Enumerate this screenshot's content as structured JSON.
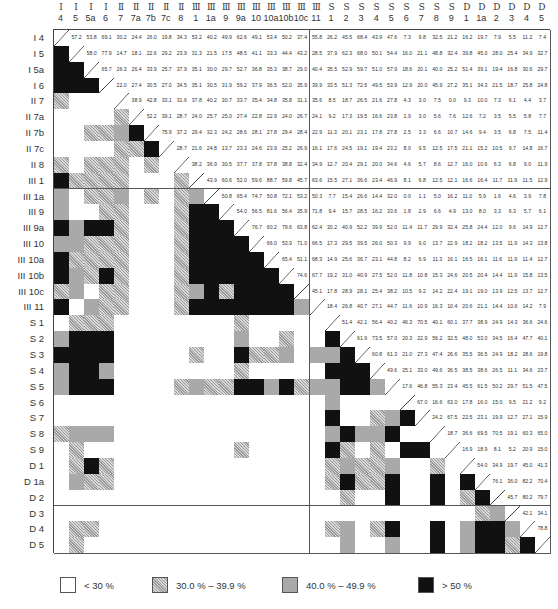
{
  "chart_data": {
    "type": "heatmap",
    "title": "",
    "layout": {
      "matrix": "symmetric; upper triangle shows values (%), lower triangle shows shaded categories",
      "diagonal": "diagonal line"
    },
    "labels": {
      "groups": [
        "I",
        "I",
        "I",
        "I",
        "II",
        "II",
        "II",
        "II",
        "II",
        "III",
        "III",
        "III",
        "III",
        "III",
        "III",
        "III",
        "III",
        "III",
        "S",
        "S",
        "S",
        "S",
        "S",
        "S",
        "S",
        "S",
        "S",
        "D",
        "D",
        "D",
        "D",
        "D",
        "D"
      ],
      "cols": [
        "4",
        "5",
        "5a",
        "6",
        "7",
        "7a",
        "7b",
        "7c",
        "8",
        "1",
        "1a",
        "9",
        "9a",
        "10",
        "10a",
        "10b",
        "10c",
        "11",
        "1",
        "2",
        "3",
        "4",
        "5",
        "6",
        "7",
        "8",
        "9",
        "1",
        "1a",
        "2",
        "3",
        "4",
        "5"
      ],
      "rows": [
        "I4",
        "I5",
        "I5a",
        "I6",
        "II7",
        "II7a",
        "II7b",
        "II7c",
        "II8",
        "III1",
        "III1a",
        "III9",
        "III9a",
        "III10",
        "III10a",
        "III10b",
        "III10c",
        "III11",
        "S1",
        "S2",
        "S3",
        "S4",
        "S5",
        "S6",
        "S7",
        "S8",
        "S9",
        "D1",
        "D1a",
        "D2",
        "D3",
        "D4",
        "D5"
      ]
    },
    "upper_values": [
      [
        57.2,
        53.8,
        69.1,
        30.2,
        24.4,
        26.0,
        19.8,
        34.3,
        53.2,
        40.2,
        49.9,
        62.6,
        49.1,
        53.4,
        50.2,
        37.4,
        55.8,
        26.2,
        45.5,
        68.4,
        43.9,
        47.6,
        7.3,
        9.8,
        32.5,
        21.2,
        16.2,
        19.7,
        7.9,
        5.5,
        11.2,
        7.4
      ],
      [
        58.0,
        77.9,
        14.7,
        18.1,
        22.6,
        29.2,
        23.9,
        31.3,
        21.5,
        17.5,
        48.5,
        41.1,
        33.3,
        44.4,
        43.2,
        28.5,
        37.9,
        62.3,
        68.0,
        50.1,
        54.4,
        16.0,
        21.1,
        48.8,
        32.4,
        39.8,
        45.0,
        28.0,
        25.4,
        34.9,
        32.7
      ],
      [
        65.7,
        26.3,
        26.4,
        33.9,
        25.7,
        37.9,
        35.1,
        30.0,
        29.7,
        52.7,
        36.8,
        35.3,
        38.7,
        29.0,
        40.4,
        35.5,
        52.9,
        59.7,
        51.0,
        57.9,
        18.6,
        20.1,
        40.0,
        25.2,
        51.4,
        39.1,
        19.4,
        16.8,
        30.6,
        29.7
      ],
      [
        22.0,
        27.4,
        30.5,
        27.0,
        34.5,
        35.1,
        30.5,
        31.9,
        59.2,
        37.9,
        36.5,
        52.0,
        35.9,
        39.9,
        33.5,
        51.3,
        72.5,
        49.5,
        53.9,
        12.9,
        20.0,
        45.9,
        27.2,
        35.1,
        34.3,
        21.5,
        18.7,
        25.8,
        24.8
      ],
      [
        38.9,
        42.8,
        33.1,
        31.6,
        37.8,
        40.2,
        30.7,
        33.7,
        35.4,
        34.8,
        35.8,
        31.1,
        35.6,
        8.5,
        18.7,
        26.5,
        21.6,
        27.8,
        4.3,
        3.0,
        7.5,
        0.0,
        9.3,
        10.0,
        7.3,
        6.1,
        4.4,
        3.7
      ],
      [
        52.2,
        39.1,
        28.7,
        24.0,
        25.7,
        25.0,
        27.4,
        22.8,
        22.9,
        24.0,
        26.7,
        24.1,
        9.2,
        17.3,
        19.5,
        16.6,
        23.8,
        1.9,
        3.0,
        5.6,
        7.6,
        12.6,
        7.2,
        3.5,
        5.5,
        5.8,
        7.7
      ],
      [
        75.9,
        37.2,
        29.4,
        32.3,
        24.2,
        28.6,
        28.1,
        27.8,
        29.4,
        28.4,
        22.9,
        11.3,
        20.1,
        23.1,
        17.8,
        27.8,
        2.5,
        3.3,
        6.6,
        10.7,
        14.6,
        9.4,
        3.5,
        6.8,
        7.5,
        11.4
      ],
      [
        28.7,
        21.6,
        24.8,
        13.7,
        23.3,
        24.6,
        23.9,
        25.2,
        26.9,
        16.1,
        17.6,
        24.5,
        19.1,
        19.4,
        23.2,
        8.0,
        9.5,
        12.5,
        17.5,
        21.1,
        15.2,
        10.5,
        9.7,
        14.8,
        16.7
      ],
      [
        38.2,
        36.9,
        30.5,
        37.7,
        37.8,
        37.8,
        38.8,
        32.4,
        34.9,
        12.7,
        20.4,
        29.1,
        20.0,
        34.6,
        4.6,
        5.7,
        8.6,
        12.7,
        16.0,
        10.6,
        6.3,
        6.8,
        9.0,
        11.9
      ],
      [
        43.9,
        60.6,
        52.0,
        59.6,
        88.7,
        59.8,
        45.7,
        63.6,
        15.5,
        27.1,
        36.6,
        23.4,
        46.9,
        8.1,
        6.8,
        12.5,
        12.1,
        16.6,
        16.4,
        11.7,
        11.9,
        11.5,
        12.9
      ],
      [
        50.8,
        65.4,
        74.7,
        50.8,
        72.1,
        53.2,
        50.3,
        7.7,
        15.4,
        26.6,
        14.4,
        32.0,
        0.0,
        1.1,
        5.0,
        16.2,
        11.0,
        5.9,
        1.6,
        4.6,
        3.9,
        7.8
      ],
      [
        54.0,
        56.5,
        81.6,
        56.4,
        35.9,
        71.8,
        9.4,
        15.7,
        28.5,
        16.2,
        33.6,
        1.8,
        2.9,
        6.6,
        4.9,
        13.0,
        8.0,
        3.3,
        6.3,
        5.7,
        6.1
      ],
      [
        76.7,
        60.2,
        79.6,
        63.8,
        62.4,
        30.2,
        40.9,
        52.2,
        39.9,
        52.0,
        11.4,
        11.7,
        29.9,
        32.4,
        25.8,
        24.4,
        12.0,
        9.6,
        14.9,
        12.7
      ],
      [
        66.0,
        53.9,
        71.0,
        66.5,
        17.3,
        29.5,
        39.5,
        26.0,
        50.3,
        9.9,
        9.0,
        13.7,
        22.9,
        18.2,
        18.2,
        13.5,
        11.9,
        14.3,
        13.8
      ],
      [
        65.4,
        51.1,
        68.3,
        14.9,
        25.6,
        36.7,
        23.1,
        44.8,
        8.2,
        6.9,
        11.3,
        16.1,
        16.5,
        16.1,
        11.6,
        11.9,
        11.4,
        12.7
      ],
      [
        74.6,
        67.7,
        19.2,
        31.0,
        40.9,
        27.5,
        52.0,
        11.8,
        10.8,
        15.3,
        24.6,
        20.5,
        20.4,
        14.4,
        11.9,
        15.8,
        13.5
      ],
      [
        45.1,
        17.8,
        28.9,
        28.1,
        25.4,
        38.2,
        10.5,
        9.2,
        14.2,
        22.4,
        19.1,
        19.0,
        13.9,
        12.5,
        13.7,
        12.7
      ],
      [
        18.4,
        26.8,
        40.7,
        27.1,
        44.7,
        11.6,
        10.9,
        16.3,
        10.4,
        20.6,
        21.1,
        14.4,
        10.6,
        14.2,
        7.9
      ],
      [
        51.4,
        42.1,
        56.4,
        40.2,
        46.3,
        70.5,
        40.1,
        60.1,
        37.7,
        38.9,
        24.9,
        14.3,
        36.6,
        24.6
      ],
      [
        61.9,
        73.5,
        57.0,
        20.3,
        22.9,
        56.2,
        32.5,
        48.0,
        53.0,
        34.5,
        16.4,
        47.7,
        40.1
      ],
      [
        60.8,
        61.3,
        21.0,
        27.3,
        47.4,
        26.6,
        35.5,
        36.5,
        24.9,
        18.2,
        28.6,
        19.8
      ],
      [
        49.6,
        25.1,
        33.0,
        49.6,
        36.5,
        38.5,
        38.6,
        26.5,
        11.1,
        34.6,
        23.7
      ],
      [
        17.6,
        46.8,
        55.3,
        23.4,
        45.5,
        61.5,
        50.2,
        29.7,
        51.5,
        47.5
      ],
      [
        67.0,
        16.6,
        63.0,
        17.8,
        16.0,
        15.0,
        9.5,
        21.2,
        9.2
      ],
      [
        24.2,
        67.5,
        22.5,
        23.1,
        19.9,
        12.7,
        27.1,
        15.9
      ],
      [
        18.7,
        36.6,
        69.5,
        70.5,
        19.1,
        60.3,
        65.0
      ],
      [
        16.9,
        18.9,
        8.1,
        5.2,
        20.9,
        15.0
      ],
      [
        54.0,
        34.9,
        19.7,
        45.0,
        41.3
      ],
      [
        76.1,
        36.0,
        82.2,
        70.4
      ],
      [
        45.7,
        80.2,
        79.7
      ],
      [
        42.1,
        34.1
      ],
      [
        78.8
      ],
      []
    ],
    "legend": [
      {
        "label": "< 30 %",
        "fill": "white",
        "color": "#ffffff",
        "range": [
          0,
          30
        ]
      },
      {
        "label": "30.0 % – 39.9 %",
        "fill": "hatched",
        "color": "#b0b0b0",
        "range": [
          30,
          40
        ]
      },
      {
        "label": "40.0 % – 49.9 %",
        "fill": "gray",
        "color": "#a9a9a9",
        "range": [
          40,
          50
        ]
      },
      {
        "label": "> 50 %",
        "fill": "black",
        "color": "#111111",
        "range": [
          50,
          100
        ]
      }
    ],
    "legend_position": "bottom"
  }
}
